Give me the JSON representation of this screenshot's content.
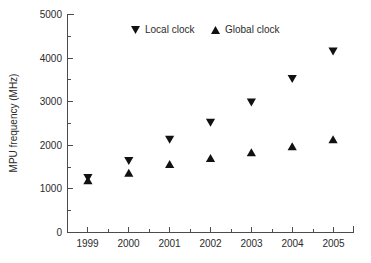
{
  "chart_data": {
    "type": "scatter",
    "title": "",
    "xlabel": "",
    "ylabel": "MPU frequency (MHz)",
    "categories": [
      "1999",
      "2000",
      "2001",
      "2002",
      "2003",
      "2004",
      "2005"
    ],
    "x": [
      1999,
      2000,
      2001,
      2002,
      2003,
      2004,
      2005
    ],
    "series": [
      {
        "name": "Local clock",
        "marker": "triangle-down",
        "color": "#111111",
        "values": [
          1250,
          1640,
          2130,
          2520,
          2980,
          3520,
          4150
        ]
      },
      {
        "name": "Global clock",
        "marker": "triangle-up",
        "color": "#111111",
        "values": [
          1200,
          1370,
          1570,
          1710,
          1840,
          1980,
          2140
        ]
      }
    ],
    "xlim": [
      1998.5,
      2005.5
    ],
    "ylim": [
      0,
      5000
    ],
    "yticks": [
      0,
      1000,
      2000,
      3000,
      4000,
      5000
    ],
    "ytick_labels": [
      "0",
      "1000",
      "2000",
      "3000",
      "4000",
      "5000"
    ],
    "yticks_minor": [
      500,
      1500,
      2500,
      3500,
      4500
    ],
    "xticks": [
      1999,
      2000,
      2001,
      2002,
      2003,
      2004,
      2005
    ],
    "xtick_labels": [
      "1999",
      "2000",
      "2001",
      "2002",
      "2003",
      "2004",
      "2005"
    ],
    "xticks_minor": [
      1998.5,
      1999.5,
      2000.5,
      2001.5,
      2002.5,
      2003.5,
      2004.5,
      2005.5
    ],
    "grid": false,
    "legend_position": "top-center",
    "legend": [
      "Local clock",
      "Global clock"
    ],
    "axis_color": "#4c4c4c",
    "background": "#ffffff"
  },
  "legend": {
    "local_label": "Local clock",
    "global_label": "Global clock"
  },
  "axes": {
    "y_title": "MPU frequency (MHz)",
    "y_labels": [
      "5000",
      "4000",
      "3000",
      "2000",
      "1000",
      "0"
    ],
    "x_labels": [
      "1999",
      "2000",
      "2001",
      "2002",
      "2003",
      "2004",
      "2005"
    ]
  }
}
